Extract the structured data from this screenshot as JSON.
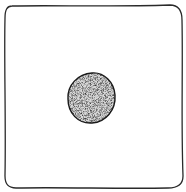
{
  "illustration": {
    "description": "Hand-drawn square outline with a stippled filled circle at center",
    "frame": {
      "shape": "square",
      "stroke": "#222222"
    },
    "dot": {
      "shape": "circle",
      "fill": "stippled",
      "stroke": "#222222",
      "base_color": "#9a9a9a"
    }
  }
}
